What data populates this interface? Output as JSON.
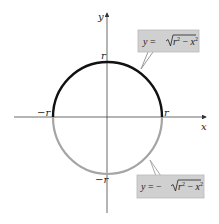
{
  "diagram": {
    "type": "circle-graph",
    "axes": {
      "x_label": "x",
      "y_label": "y"
    },
    "tick_labels": {
      "x_positive": "r",
      "x_negative": "−r",
      "y_positive": "r",
      "y_negative": "−r"
    },
    "curves": [
      {
        "name": "upper-semicircle",
        "equation_lhs": "y = ",
        "sign": "",
        "radicand_r": "r",
        "radicand_minus": " − ",
        "radicand_x": "x",
        "exponent": "2",
        "color": "#111111"
      },
      {
        "name": "lower-semicircle",
        "equation_lhs": "y = ",
        "sign": "−",
        "radicand_r": "r",
        "radicand_minus": " − ",
        "radicand_x": "x",
        "exponent": "2",
        "color": "#a0a0a0"
      }
    ],
    "callout_fill": "#cfcfcf",
    "callout_border": "#b5b5b5"
  }
}
